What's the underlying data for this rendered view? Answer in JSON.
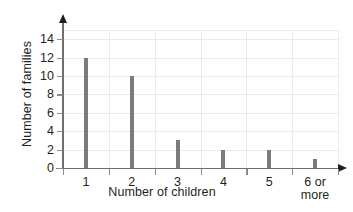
{
  "chart_data": {
    "type": "bar",
    "title": "",
    "xlabel": "Number of children",
    "ylabel": "Number of families",
    "categories": [
      "1",
      "2",
      "3",
      "4",
      "5",
      "6 or\nmore"
    ],
    "category_labels": [
      {
        "lines": [
          "1"
        ]
      },
      {
        "lines": [
          "2"
        ]
      },
      {
        "lines": [
          "3"
        ]
      },
      {
        "lines": [
          "4"
        ]
      },
      {
        "lines": [
          "5"
        ]
      },
      {
        "lines": [
          "6 or",
          "more"
        ]
      }
    ],
    "values": [
      12,
      10,
      3,
      2,
      2,
      1
    ],
    "ylim": [
      0,
      15
    ],
    "y_ticks": [
      0,
      2,
      4,
      6,
      8,
      10,
      12,
      14
    ],
    "y_tick_labels": [
      "0",
      "2",
      "4",
      "6",
      "8",
      "10",
      "12",
      "14"
    ],
    "grid": true,
    "legend": false,
    "bar_color": "#7c7c7c",
    "grid_color": "#eceaea",
    "axis_color": "#6e6e6e",
    "text_color": "#231f20"
  }
}
